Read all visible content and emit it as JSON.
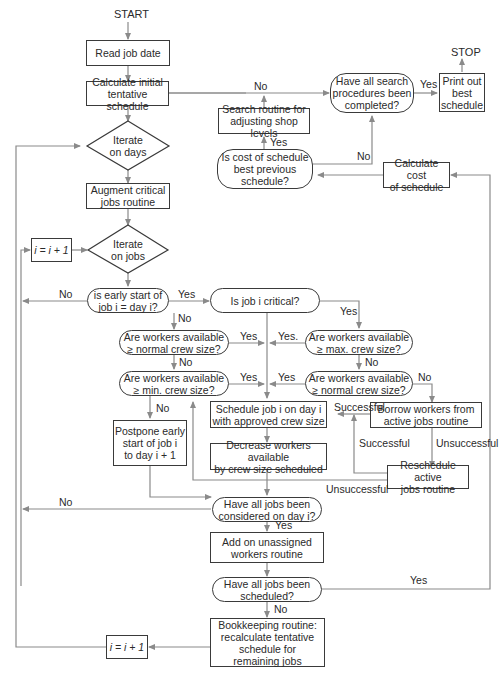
{
  "diagram": {
    "type": "flowchart",
    "terminals": {
      "start": "START",
      "stop": "STOP"
    },
    "nodes": {
      "read_job": "Read job date",
      "calc_initial": "Calculate initial\ntentative schedule",
      "iterate_days": "Iterate\non days",
      "augment": "Augment critical\njobs routine",
      "inc_i_top": "i = i + 1",
      "iterate_jobs": "Iterate\non jobs",
      "early_start": "is early start of\njob i = day i?",
      "job_critical": "Is job i critical?",
      "normal_crew_left": "Are workers available\n≥ normal crew size?",
      "max_crew": "Are workers available\n≥ max. crew size?",
      "min_crew": "Are workers available\n≥ min. crew size?",
      "normal_crew_right": "Are workers available\n≥ normal crew size?",
      "schedule_job": "Schedule job i on day i\nwith approved crew size",
      "borrow": "Borrow workers from\nactive jobs routine",
      "postpone": "Postpone early\nstart of job i\nto day i + 1",
      "decrease": "Decrease workers available\nby crew size scheduled",
      "reschedule": "Reschedule active\njobs routine",
      "all_considered": "Have all jobs been\nconsidered on day i?",
      "add_unassigned": "Add on unassigned\nworkers routine",
      "all_scheduled": "Have all jobs been\nscheduled?",
      "bookkeeping": "Bookkeeping routine:\nrecalculate tentative\nschedule for\nremaining jobs",
      "inc_i_bottom": "i = i + 1",
      "search_done": "Have all search\nprocedures been\ncompleted?",
      "print_best": "Print out\nbest\nschedule",
      "search_routine": "Search routine for\nadjusting shop levels",
      "cost_best": "Is cost of schedule\nbest previous\nschedule?",
      "calc_cost": "Calculate cost\nof schedule"
    },
    "edge_labels": {
      "calc_to_search_no": "No",
      "search_yes": "Yes",
      "cost_yes": "Yes",
      "cost_no": "No",
      "early_no": "No",
      "early_yes": "Yes",
      "early_down_no": "No",
      "critical_yes": "Yes",
      "normal_left_yes": "Yes",
      "max_yes": "Yes.",
      "normal_left_no": "No",
      "max_no": "No",
      "min_yes": "Yes",
      "normal_right_yes": "Yes",
      "normal_right_no": "No",
      "min_no": "No",
      "borrow_successful": "Successful",
      "reschedule_successful": "Successful",
      "borrow_unsuccessful": "Unsuccessful",
      "reschedule_unsuccessful": "Unsuccessful",
      "considered_no": "No",
      "considered_yes": "Yes",
      "scheduled_yes": "Yes",
      "scheduled_no": "No"
    },
    "colors": {
      "line": "#8a8a8a",
      "border": "#3a3a3a",
      "text": "#2a2a2a"
    }
  }
}
